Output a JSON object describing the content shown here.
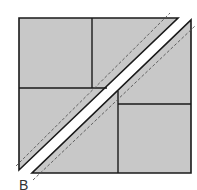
{
  "diagram": {
    "label": "B",
    "colors": {
      "fill": "#c8c8c8",
      "stroke": "#1a1a1a",
      "gap": "#ffffff",
      "dashed": "#555555"
    },
    "pieces": [
      {
        "name": "upper-left-half",
        "points": "19,18 178,18 19,170"
      },
      {
        "name": "lower-right-half",
        "points": "191,20 191,173 32,173"
      }
    ],
    "seams": [
      {
        "name": "upper-left-square-right",
        "x1": 92,
        "y1": 18,
        "x2": 92,
        "y2": 88
      },
      {
        "name": "upper-left-square-bottom",
        "x1": 19,
        "y1": 88,
        "x2": 107,
        "y2": 88
      },
      {
        "name": "lower-right-square-left",
        "x1": 118,
        "y1": 91,
        "x2": 118,
        "y2": 173
      },
      {
        "name": "lower-right-square-top",
        "x1": 118,
        "y1": 104,
        "x2": 191,
        "y2": 104
      }
    ],
    "dashed_lines": [
      {
        "name": "upper-seam-allowance",
        "x1": 16,
        "y1": 166,
        "x2": 170,
        "y2": 13
      },
      {
        "name": "lower-seam-allowance",
        "x1": 33,
        "y1": 180,
        "x2": 195,
        "y2": 26
      }
    ]
  }
}
